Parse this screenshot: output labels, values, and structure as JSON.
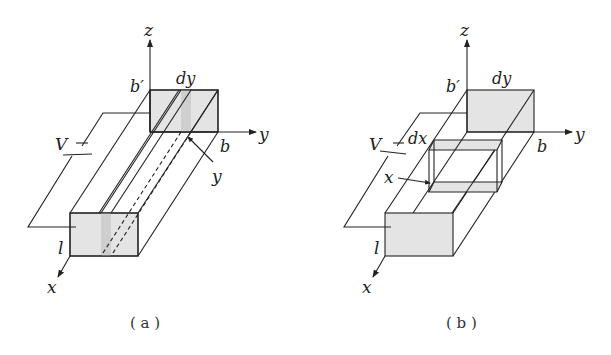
{
  "figure": {
    "panels": [
      {
        "id": "a",
        "caption": "( a )",
        "labels": {
          "z_axis": "z",
          "y_axis": "y",
          "x_axis": "x",
          "b_prime": "b′",
          "b": "b",
          "dy": "dy",
          "V": "V",
          "l": "l",
          "y_pointer": "y"
        }
      },
      {
        "id": "b",
        "caption": "( b )",
        "labels": {
          "z_axis": "z",
          "y_axis": "y",
          "x_axis": "x",
          "b_prime": "b′",
          "b": "b",
          "dy": "dy",
          "dx": "dx",
          "V": "V",
          "l": "l",
          "x_pointer": "x"
        }
      }
    ],
    "colors": {
      "stroke": "#222222",
      "face_fill": "#e4e4e4",
      "strip_fill": "#cfcfcf"
    }
  }
}
